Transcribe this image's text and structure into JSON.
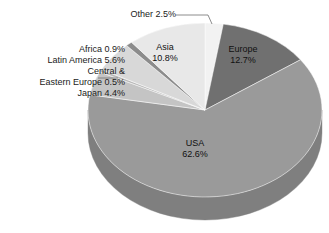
{
  "chart_data": {
    "type": "pie",
    "title": "",
    "subtitle": "",
    "xlabel": "",
    "ylabel": "",
    "style": "3d-pie",
    "legend_position": "none",
    "grid": false,
    "units": "percent",
    "total": 100.0,
    "start_angle_deg": 0,
    "direction": "clockwise",
    "categories": [
      "Other",
      "Europe",
      "USA",
      "Japan",
      "Central & Eastern Europe",
      "Latin America",
      "Africa",
      "Asia"
    ],
    "values": [
      2.5,
      12.7,
      62.6,
      4.4,
      0.5,
      5.6,
      0.9,
      10.8
    ],
    "slices": [
      {
        "label": "Other",
        "value": 2.5,
        "value_text": "2.5%",
        "color": "#f2f2f2",
        "side_color": "#cfcfcf",
        "label_placement": "outside"
      },
      {
        "label": "Europe",
        "value": 12.7,
        "value_text": "12.7%",
        "color": "#707070",
        "side_color": "#5d5d5d",
        "label_placement": "inside"
      },
      {
        "label": "USA",
        "value": 62.6,
        "value_text": "62.6%",
        "color": "#9a9a9a",
        "side_color": "#7f7f7f",
        "label_placement": "inside"
      },
      {
        "label": "Japan",
        "value": 4.4,
        "value_text": "4.4%",
        "color": "#c4c4c4",
        "side_color": "#a6a6a6",
        "label_placement": "outside"
      },
      {
        "label": "Central & Eastern Europe",
        "value": 0.5,
        "value_text": "0.5%",
        "color": "#b8b8b8",
        "side_color": "#9c9c9c",
        "label_placement": "outside"
      },
      {
        "label": "Latin America",
        "value": 5.6,
        "value_text": "5.6%",
        "color": "#d8d8d8",
        "side_color": "#b5b5b5",
        "label_placement": "outside"
      },
      {
        "label": "Africa",
        "value": 0.9,
        "value_text": "0.9%",
        "color": "#8c8c8c",
        "side_color": "#767676",
        "label_placement": "outside"
      },
      {
        "label": "Asia",
        "value": 10.8,
        "value_text": "10.8%",
        "color": "#e8e8e8",
        "side_color": "#c6c6c6",
        "label_placement": "inside"
      }
    ]
  },
  "labels": {
    "other": {
      "name": "Other",
      "value": "2.5%",
      "text": "Other 2.5%"
    },
    "africa": {
      "name": "Africa",
      "value": "0.9%",
      "text": "Africa 0.9%"
    },
    "latin_america": {
      "name": "Latin America",
      "value": "5.6%",
      "text": "Latin America 5.6%"
    },
    "central_eastern_europe_line1": {
      "text": "Central &"
    },
    "central_eastern_europe_line2": {
      "text": "Eastern Europe 0.5%"
    },
    "japan": {
      "name": "Japan",
      "value": "4.4%",
      "text": "Japan 4.4%"
    },
    "asia_name": {
      "text": "Asia"
    },
    "asia_value": {
      "text": "10.8%"
    },
    "europe_name": {
      "text": "Europe"
    },
    "europe_value": {
      "text": "12.7%"
    },
    "usa_name": {
      "text": "USA"
    },
    "usa_value": {
      "text": "62.6%"
    }
  },
  "colors": {
    "background": "#ffffff",
    "text": "#1a1a1a",
    "leader_line": "#6e6e6e",
    "europe": "#707070",
    "usa": "#9a9a9a",
    "asia": "#e8e8e8",
    "other": "#f2f2f2",
    "japan": "#c4c4c4",
    "central_eastern_europe": "#b8b8b8",
    "latin_america": "#d8d8d8",
    "africa": "#8c8c8c"
  }
}
